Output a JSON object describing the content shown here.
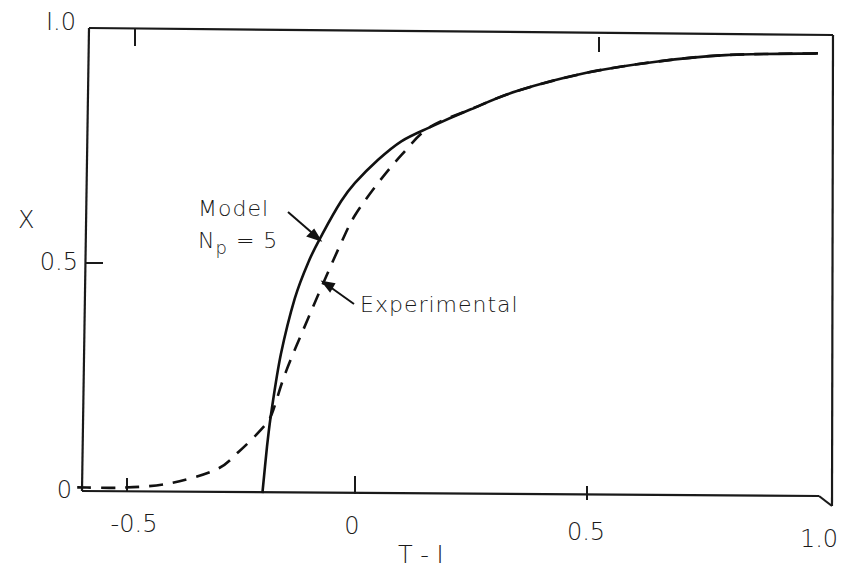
{
  "chart_data": {
    "type": "line",
    "title": "",
    "xlabel": "T - 1",
    "ylabel": "X",
    "xlim": [
      -0.6,
      1.0
    ],
    "ylim": [
      0,
      1.0
    ],
    "grid": false,
    "legend_position": "inline annotations",
    "x_ticks": [
      "-0.5",
      "0",
      "0.5",
      "1.0"
    ],
    "y_ticks": [
      "0",
      "0.5",
      "1.0"
    ],
    "series": [
      {
        "name": "Model Np = 5",
        "style": "solid",
        "x": [
          -0.2,
          -0.19,
          -0.18,
          -0.16,
          -0.13,
          -0.1,
          -0.07,
          -0.03,
          0.0,
          0.05,
          0.1,
          0.16,
          0.25,
          0.35,
          0.5,
          0.65,
          0.8,
          1.0
        ],
        "y": [
          0.0,
          0.1,
          0.18,
          0.3,
          0.42,
          0.5,
          0.56,
          0.63,
          0.67,
          0.72,
          0.76,
          0.79,
          0.83,
          0.87,
          0.91,
          0.935,
          0.95,
          0.955
        ]
      },
      {
        "name": "Experimental",
        "style": "dashed",
        "x": [
          -0.6,
          -0.5,
          -0.4,
          -0.3,
          -0.25,
          -0.2,
          -0.18,
          -0.15,
          -0.1,
          -0.07,
          -0.03,
          0.0,
          0.05,
          0.1,
          0.16,
          0.25,
          0.35,
          0.5,
          0.65,
          0.8,
          1.0
        ],
        "y": [
          0.01,
          0.01,
          0.02,
          0.05,
          0.09,
          0.14,
          0.17,
          0.26,
          0.38,
          0.45,
          0.54,
          0.6,
          0.67,
          0.73,
          0.79,
          0.83,
          0.87,
          0.91,
          0.935,
          0.95,
          0.955
        ]
      }
    ],
    "annotations": [
      {
        "text_line1": "Model",
        "text_line2": "Np = 5",
        "points_to": "solid curve near T-1 = -0.07, X = 0.55"
      },
      {
        "text": "Experimental",
        "points_to": "dashed curve near T-1 = -0.06, X = 0.46"
      }
    ]
  },
  "labels": {
    "xlabel": "T - I",
    "ylabel": "X",
    "x_ticks": [
      "-0.5",
      "0",
      "0.5",
      "1.0"
    ],
    "y_ticks": [
      "0",
      "0.5",
      "I.0"
    ],
    "model_line1": "Model",
    "model_line2_main": "N",
    "model_line2_sub": "p",
    "model_line2_rest": " = 5",
    "experimental": "Experimental"
  }
}
